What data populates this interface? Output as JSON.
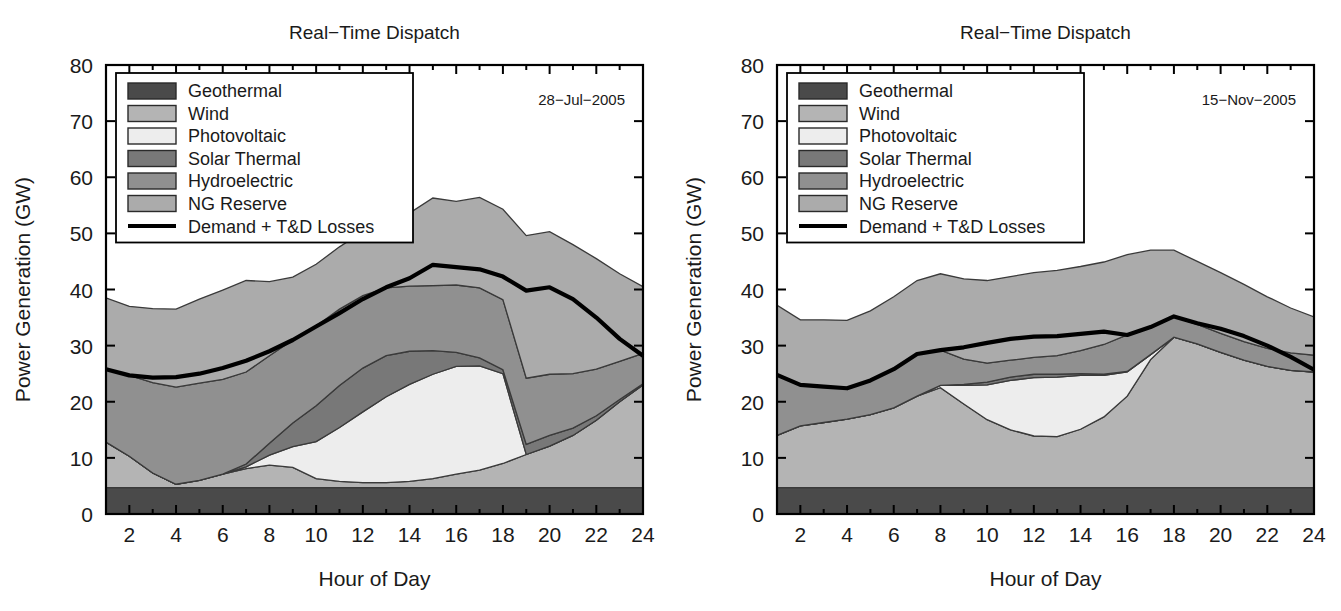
{
  "figure": {
    "panel_count": 2,
    "ylabel": "Power Generation (GW)",
    "xlabel": "Hour of Day",
    "title": "Real−Time Dispatch"
  },
  "legend": {
    "items": [
      {
        "label": "Geothermal",
        "color": "#4a4a4a"
      },
      {
        "label": "Wind",
        "color": "#b4b4b4"
      },
      {
        "label": "Photovoltaic",
        "color": "#ededed"
      },
      {
        "label": "Solar Thermal",
        "color": "#787878"
      },
      {
        "label": "Hydroelectric",
        "color": "#909090"
      },
      {
        "label": "NG Reserve",
        "color": "#ababab"
      }
    ],
    "line_item": {
      "label": "Demand + T&D Losses",
      "color": "#000000"
    }
  },
  "chart_data": [
    {
      "type": "area",
      "stacked": true,
      "title": "Real−Time Dispatch",
      "annotation": "28−Jul−2005",
      "xlabel": "Hour of Day",
      "ylabel": "Power Generation (GW)",
      "xlim": [
        1,
        24
      ],
      "ylim": [
        0,
        80
      ],
      "xticks": [
        2,
        4,
        6,
        8,
        10,
        12,
        14,
        16,
        18,
        20,
        22,
        24
      ],
      "yticks": [
        0,
        10,
        20,
        30,
        40,
        50,
        60,
        70,
        80
      ],
      "grid": false,
      "legend_position": "upper-left",
      "x": [
        1,
        2,
        3,
        4,
        5,
        6,
        7,
        8,
        9,
        10,
        11,
        12,
        13,
        14,
        15,
        16,
        17,
        18,
        19,
        20,
        21,
        22,
        23,
        24
      ],
      "series": [
        {
          "name": "Geothermal",
          "values": [
            4.7,
            4.7,
            4.7,
            4.7,
            4.7,
            4.7,
            4.7,
            4.7,
            4.7,
            4.7,
            4.7,
            4.7,
            4.7,
            4.7,
            4.7,
            4.7,
            4.7,
            4.7,
            4.7,
            4.7,
            4.7,
            4.7,
            4.7,
            4.7
          ]
        },
        {
          "name": "Wind",
          "values": [
            8.1,
            5.6,
            2.6,
            0.6,
            1.3,
            2.4,
            3.4,
            4.0,
            3.6,
            1.6,
            1.1,
            0.9,
            0.9,
            1.1,
            1.6,
            2.4,
            3.1,
            4.3,
            5.9,
            7.4,
            9.3,
            12.0,
            15.3,
            18.3
          ]
        },
        {
          "name": "Photovoltaic",
          "values": [
            0,
            0,
            0,
            0,
            0,
            0,
            0.3,
            1.8,
            3.7,
            6.6,
            9.6,
            12.6,
            15.3,
            17.3,
            18.6,
            19.2,
            18.6,
            16.0,
            0,
            0,
            0,
            0,
            0,
            0
          ]
        },
        {
          "name": "Solar Thermal",
          "values": [
            0,
            0,
            0,
            0,
            0,
            0,
            0.5,
            2.1,
            4.2,
            6.4,
            7.5,
            7.8,
            7.3,
            5.9,
            4.2,
            2.5,
            1.4,
            0.7,
            1.8,
            1.9,
            1.3,
            0.8,
            0.4,
            0.2
          ]
        },
        {
          "name": "Hydroelectric",
          "values": [
            13.0,
            14.4,
            16.1,
            17.3,
            17.3,
            16.9,
            16.4,
            15.6,
            14.8,
            14.2,
            13.6,
            12.9,
            12.1,
            11.6,
            11.6,
            12.0,
            12.5,
            12.5,
            11.8,
            10.9,
            9.7,
            8.3,
            6.8,
            5.4
          ]
        },
        {
          "name": "NG Reserve",
          "values": [
            12.7,
            12.3,
            13.2,
            13.9,
            15.0,
            15.9,
            16.3,
            13.2,
            11.2,
            11.0,
            11.1,
            11.4,
            12.1,
            13.0,
            15.6,
            14.9,
            16.1,
            16.1,
            25.4,
            25.4,
            23.0,
            19.7,
            15.6,
            11.9
          ]
        }
      ],
      "demand_line": {
        "name": "Demand + T&D Losses",
        "values": [
          25.8,
          24.7,
          24.3,
          24.4,
          25.0,
          26.0,
          27.3,
          29.0,
          31.0,
          33.4,
          35.8,
          38.3,
          40.4,
          42.0,
          44.4,
          44.0,
          43.6,
          42.3,
          39.8,
          40.4,
          38.3,
          35.0,
          31.2,
          28.2
        ]
      }
    },
    {
      "type": "area",
      "stacked": true,
      "title": "Real−Time Dispatch",
      "annotation": "15−Nov−2005",
      "xlabel": "Hour of Day",
      "ylabel": "Power Generation (GW)",
      "xlim": [
        1,
        24
      ],
      "ylim": [
        0,
        80
      ],
      "xticks": [
        2,
        4,
        6,
        8,
        10,
        12,
        14,
        16,
        18,
        20,
        22,
        24
      ],
      "yticks": [
        0,
        10,
        20,
        30,
        40,
        50,
        60,
        70,
        80
      ],
      "grid": false,
      "legend_position": "upper-left",
      "x": [
        1,
        2,
        3,
        4,
        5,
        6,
        7,
        8,
        9,
        10,
        11,
        12,
        13,
        14,
        15,
        16,
        17,
        18,
        19,
        20,
        21,
        22,
        23,
        24
      ],
      "series": [
        {
          "name": "Geothermal",
          "values": [
            4.7,
            4.7,
            4.7,
            4.7,
            4.7,
            4.7,
            4.7,
            4.7,
            4.7,
            4.7,
            4.7,
            4.7,
            4.7,
            4.7,
            4.7,
            4.7,
            4.7,
            4.7,
            4.7,
            4.7,
            4.7,
            4.7,
            4.7,
            4.7
          ]
        },
        {
          "name": "Wind",
          "values": [
            9.3,
            11.0,
            11.6,
            12.2,
            13.0,
            14.2,
            16.3,
            17.8,
            14.9,
            12.1,
            10.3,
            9.2,
            9.1,
            10.4,
            12.6,
            16.3,
            22.8,
            26.8,
            25.6,
            24.1,
            22.7,
            21.6,
            20.9,
            20.6
          ]
        },
        {
          "name": "Photovoltaic",
          "values": [
            0,
            0,
            0,
            0,
            0,
            0,
            0,
            0.4,
            3.3,
            6.2,
            8.8,
            10.4,
            10.6,
            9.6,
            7.4,
            4.3,
            0.9,
            0,
            0,
            0,
            0,
            0,
            0,
            0
          ]
        },
        {
          "name": "Solar Thermal",
          "values": [
            0,
            0,
            0,
            0,
            0,
            0,
            0,
            0,
            0.2,
            0.5,
            0.6,
            0.6,
            0.5,
            0.3,
            0.2,
            0.1,
            0,
            0,
            0,
            0,
            0,
            0,
            0,
            0
          ]
        },
        {
          "name": "Hydroelectric",
          "values": [
            10.8,
            7.3,
            6.4,
            5.5,
            6.1,
            6.9,
            7.5,
            6.3,
            4.5,
            3.4,
            3.0,
            3.0,
            3.3,
            4.1,
            5.3,
            6.5,
            4.9,
            3.6,
            3.5,
            3.4,
            3.3,
            3.2,
            3.1,
            3.0
          ]
        },
        {
          "name": "NG Reserve",
          "values": [
            12.4,
            11.6,
            11.9,
            12.1,
            12.4,
            12.9,
            13.1,
            13.6,
            14.3,
            14.7,
            14.9,
            15.1,
            15.2,
            15.0,
            14.7,
            14.3,
            13.7,
            11.9,
            11.2,
            10.8,
            10.2,
            9.2,
            8.0,
            6.8
          ]
        }
      ],
      "demand_line": {
        "name": "Demand + T&D Losses",
        "values": [
          24.8,
          23.0,
          22.7,
          22.4,
          23.8,
          25.8,
          28.5,
          29.2,
          29.7,
          30.5,
          31.2,
          31.6,
          31.7,
          32.1,
          32.5,
          31.9,
          33.3,
          35.2,
          34.0,
          33.0,
          31.7,
          30.0,
          28.0,
          25.7
        ]
      }
    }
  ]
}
